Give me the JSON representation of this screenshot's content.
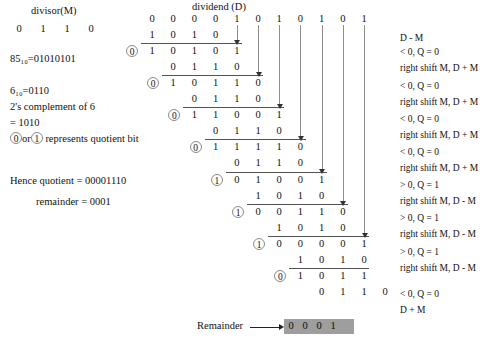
{
  "headers": {
    "divisor_label": "divisor(M)",
    "dividend_label": "dividend (D)"
  },
  "divisor_bits": [
    "0",
    "1",
    "1",
    "0"
  ],
  "left_notes": [
    "85₁₀=01010101",
    "6₁₀=0110",
    "2's complement of 6",
    "= 1010"
  ],
  "legend": {
    "bit_zero": "0",
    "bit_one": "1",
    "pre": "or",
    "post": "represents quotient bit"
  },
  "results": {
    "quotient_line": "Hence quotient = 00001110",
    "remainder_line": "remainder = 0001"
  },
  "remainder": {
    "label": "Remainder",
    "bits": [
      "0",
      "0",
      "0",
      "1"
    ]
  },
  "dividend_bits": [
    "0",
    "0",
    "0",
    "0",
    "1",
    "0",
    "1",
    "0",
    "1",
    "0",
    "1"
  ],
  "rows": [
    {
      "kind": "dividend",
      "quotient": null,
      "bits": [
        "0",
        "0",
        "0",
        "0",
        "1",
        "0",
        "1",
        "0",
        "1",
        "0",
        "1"
      ]
    },
    {
      "kind": "operand",
      "quotient": null,
      "bits": [
        "1",
        "0",
        "1",
        "0"
      ]
    },
    {
      "kind": "result",
      "quotient": "0",
      "bits": [
        "1",
        "0",
        "1",
        "0",
        "1"
      ]
    },
    {
      "kind": "operand",
      "quotient": null,
      "bits": [
        "0",
        "1",
        "1",
        "0"
      ]
    },
    {
      "kind": "result",
      "quotient": "0",
      "bits": [
        "1",
        "0",
        "1",
        "1",
        "0"
      ]
    },
    {
      "kind": "operand",
      "quotient": null,
      "bits": [
        "0",
        "1",
        "1",
        "0"
      ]
    },
    {
      "kind": "result",
      "quotient": "0",
      "bits": [
        "1",
        "1",
        "0",
        "0",
        "1"
      ]
    },
    {
      "kind": "operand",
      "quotient": null,
      "bits": [
        "0",
        "1",
        "1",
        "0"
      ]
    },
    {
      "kind": "result",
      "quotient": "0",
      "bits": [
        "1",
        "1",
        "1",
        "1",
        "0"
      ]
    },
    {
      "kind": "operand",
      "quotient": null,
      "bits": [
        "0",
        "1",
        "1",
        "0"
      ]
    },
    {
      "kind": "result",
      "quotient": "1",
      "bits": [
        "0",
        "1",
        "0",
        "0",
        "1"
      ]
    },
    {
      "kind": "operand",
      "quotient": null,
      "bits": [
        "1",
        "0",
        "1",
        "0"
      ]
    },
    {
      "kind": "result",
      "quotient": "1",
      "bits": [
        "0",
        "0",
        "1",
        "1",
        "0"
      ]
    },
    {
      "kind": "operand",
      "quotient": null,
      "bits": [
        "1",
        "0",
        "1",
        "0"
      ]
    },
    {
      "kind": "result",
      "quotient": "1",
      "bits": [
        "0",
        "0",
        "0",
        "0",
        "1"
      ]
    },
    {
      "kind": "operand",
      "quotient": null,
      "bits": [
        "1",
        "0",
        "1",
        "0"
      ]
    },
    {
      "kind": "result",
      "quotient": "0",
      "bits": [
        "1",
        "0",
        "1",
        "1"
      ]
    },
    {
      "kind": "operand",
      "quotient": null,
      "bits": [
        "0",
        "1",
        "1",
        "0"
      ]
    }
  ],
  "right_notes": [
    "D - M",
    "< 0,  Q = 0",
    "right shift M,  D + M",
    "< 0,  Q = 0",
    "right shift M,  D + M",
    "< 0,  Q = 0",
    "right shift M,  D + M",
    "< 0,  Q = 0",
    "right shift M,  D + M",
    "> 0,  Q = 1",
    "right shift M,  D - M",
    "> 0,  Q = 1",
    "right shift M,  D - M",
    "> 0,  Q = 1",
    "right shift M,  D - M",
    "< 0,  Q = 0",
    "D + M"
  ],
  "colors": {
    "remainder_bg": "#9e9e9e",
    "rule": "#555555",
    "vline": "#8d8d8d",
    "circle": "#8a8a8a"
  }
}
